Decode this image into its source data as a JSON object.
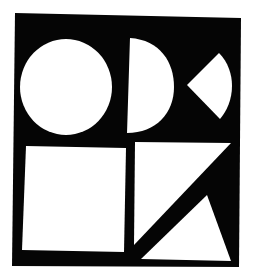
{
  "artwork": {
    "background": "#ffffff",
    "panel_color": "#050505",
    "shape_color": "#ffffff",
    "shapes": [
      {
        "name": "circle"
      },
      {
        "name": "semicircle"
      },
      {
        "name": "quarter-circle-wedge"
      },
      {
        "name": "square"
      },
      {
        "name": "upper-right-triangle"
      },
      {
        "name": "lower-triangle"
      }
    ]
  }
}
